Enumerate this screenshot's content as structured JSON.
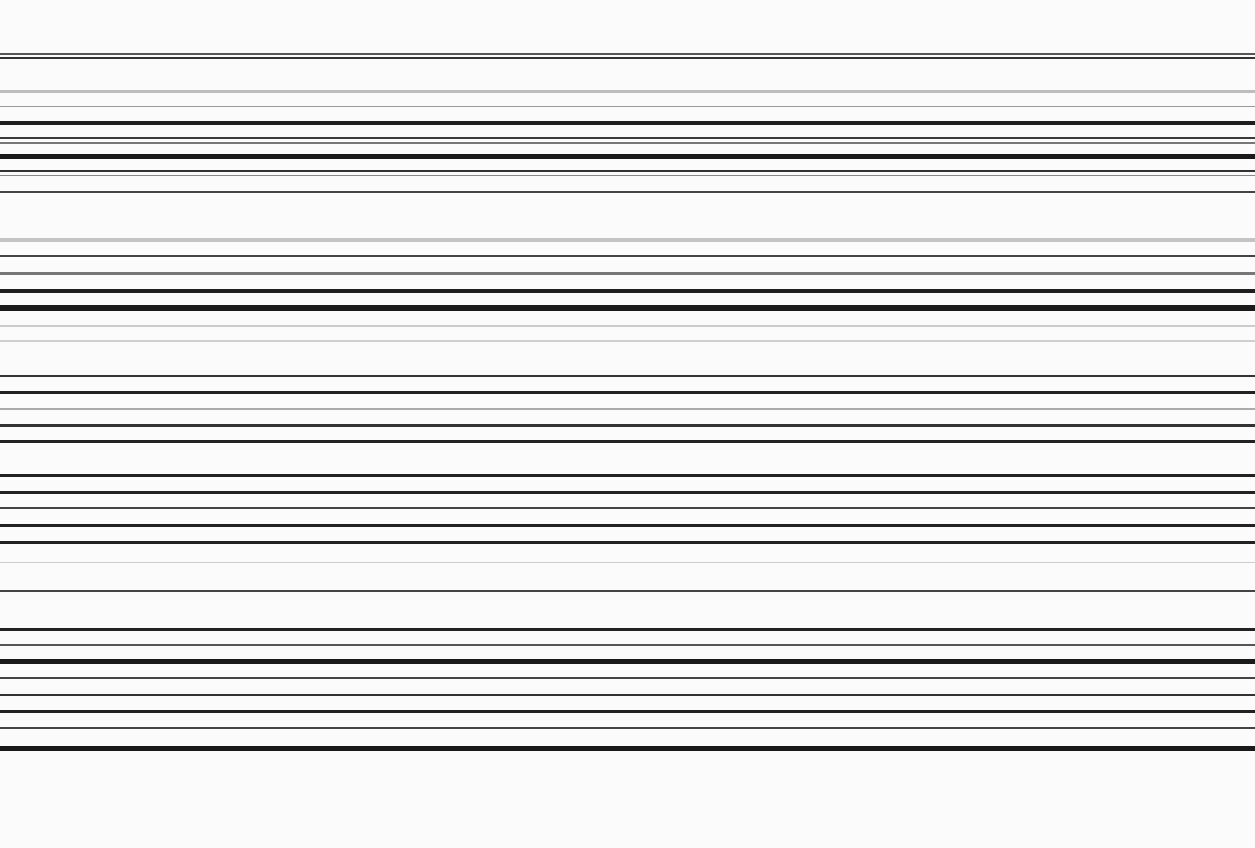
{
  "size": {
    "width": 1255,
    "height": 848
  },
  "background": "#fbfbfb",
  "stripes": [
    {
      "y": 53,
      "h": 2,
      "color": "#555555"
    },
    {
      "y": 57,
      "h": 2,
      "color": "#333333"
    },
    {
      "y": 90,
      "h": 3,
      "color": "#bdbdbd"
    },
    {
      "y": 106,
      "h": 1,
      "color": "#9a9a9a"
    },
    {
      "y": 121,
      "h": 4,
      "color": "#1e1e1e"
    },
    {
      "y": 137,
      "h": 2,
      "color": "#3a3a3a"
    },
    {
      "y": 142,
      "h": 2,
      "color": "#777777"
    },
    {
      "y": 154,
      "h": 5,
      "color": "#1a1a1a"
    },
    {
      "y": 170,
      "h": 2,
      "color": "#333333"
    },
    {
      "y": 175,
      "h": 1,
      "color": "#888888"
    },
    {
      "y": 191,
      "h": 2,
      "color": "#444444"
    },
    {
      "y": 238,
      "h": 4,
      "color": "#c4c4c4"
    },
    {
      "y": 255,
      "h": 2,
      "color": "#444444"
    },
    {
      "y": 272,
      "h": 3,
      "color": "#777777"
    },
    {
      "y": 289,
      "h": 4,
      "color": "#1e1e1e"
    },
    {
      "y": 305,
      "h": 6,
      "color": "#1a1a1a"
    },
    {
      "y": 325,
      "h": 2,
      "color": "#cccccc"
    },
    {
      "y": 340,
      "h": 2,
      "color": "#cfcfcf"
    },
    {
      "y": 375,
      "h": 2,
      "color": "#333333"
    },
    {
      "y": 391,
      "h": 3,
      "color": "#222222"
    },
    {
      "y": 408,
      "h": 2,
      "color": "#aaaaaa"
    },
    {
      "y": 424,
      "h": 3,
      "color": "#333333"
    },
    {
      "y": 440,
      "h": 3,
      "color": "#222222"
    },
    {
      "y": 474,
      "h": 3,
      "color": "#222222"
    },
    {
      "y": 491,
      "h": 3,
      "color": "#222222"
    },
    {
      "y": 507,
      "h": 2,
      "color": "#444444"
    },
    {
      "y": 524,
      "h": 3,
      "color": "#222222"
    },
    {
      "y": 541,
      "h": 3,
      "color": "#222222"
    },
    {
      "y": 562,
      "h": 1,
      "color": "#cccccc"
    },
    {
      "y": 590,
      "h": 2,
      "color": "#444444"
    },
    {
      "y": 628,
      "h": 3,
      "color": "#222222"
    },
    {
      "y": 644,
      "h": 2,
      "color": "#555555"
    },
    {
      "y": 659,
      "h": 5,
      "color": "#1a1a1a"
    },
    {
      "y": 677,
      "h": 2,
      "color": "#444444"
    },
    {
      "y": 694,
      "h": 2,
      "color": "#333333"
    },
    {
      "y": 710,
      "h": 3,
      "color": "#222222"
    },
    {
      "y": 727,
      "h": 2,
      "color": "#444444"
    },
    {
      "y": 746,
      "h": 5,
      "color": "#1a1a1a"
    }
  ]
}
